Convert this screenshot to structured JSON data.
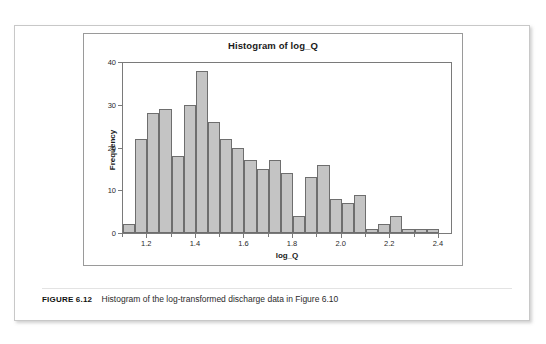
{
  "figure": {
    "caption_label": "FIGURE 6.12",
    "caption_text": "Histogram of the log-transformed discharge data in Figure 6.10"
  },
  "colors": {
    "bar_fill": "#c4c4c4",
    "bar_stroke": "#6e6e6e",
    "axis": "#7a7a7a",
    "panel_border": "#c8c8c8",
    "plot_border": "#9a9a9a",
    "text": "#1a1a1a",
    "page_background": "#ffffff"
  },
  "chart_data": {
    "type": "bar",
    "title": "Histogram of log_Q",
    "xlabel": "log_Q",
    "ylabel": "Frequency",
    "xlim": [
      1.1,
      2.45
    ],
    "ylim": [
      0,
      40
    ],
    "grid": false,
    "legend": null,
    "bin_width": 0.05,
    "x_ticks": [
      1.2,
      1.4,
      1.6,
      1.8,
      2.0,
      2.2,
      2.4
    ],
    "x_tick_labels": [
      "1.2",
      "1.4",
      "1.6",
      "1.8",
      "2.0",
      "2.2",
      "2.4"
    ],
    "x_minor_ticks": [
      1.1,
      1.3,
      1.5,
      1.7,
      1.9,
      2.1,
      2.3
    ],
    "y_ticks": [
      0,
      10,
      20,
      30,
      40
    ],
    "y_tick_labels": [
      "0",
      "10",
      "20",
      "30",
      "40"
    ],
    "bins": [
      {
        "left": 1.1,
        "right": 1.15,
        "center": 1.125,
        "value": 2
      },
      {
        "left": 1.15,
        "right": 1.2,
        "center": 1.175,
        "value": 22
      },
      {
        "left": 1.2,
        "right": 1.25,
        "center": 1.225,
        "value": 28
      },
      {
        "left": 1.25,
        "right": 1.3,
        "center": 1.275,
        "value": 29
      },
      {
        "left": 1.3,
        "right": 1.35,
        "center": 1.325,
        "value": 18
      },
      {
        "left": 1.35,
        "right": 1.4,
        "center": 1.375,
        "value": 30
      },
      {
        "left": 1.4,
        "right": 1.45,
        "center": 1.425,
        "value": 38
      },
      {
        "left": 1.45,
        "right": 1.5,
        "center": 1.475,
        "value": 26
      },
      {
        "left": 1.5,
        "right": 1.55,
        "center": 1.525,
        "value": 22
      },
      {
        "left": 1.55,
        "right": 1.6,
        "center": 1.575,
        "value": 20
      },
      {
        "left": 1.6,
        "right": 1.65,
        "center": 1.625,
        "value": 17
      },
      {
        "left": 1.65,
        "right": 1.7,
        "center": 1.675,
        "value": 15
      },
      {
        "left": 1.7,
        "right": 1.75,
        "center": 1.725,
        "value": 17
      },
      {
        "left": 1.75,
        "right": 1.8,
        "center": 1.775,
        "value": 14
      },
      {
        "left": 1.8,
        "right": 1.85,
        "center": 1.825,
        "value": 4
      },
      {
        "left": 1.85,
        "right": 1.9,
        "center": 1.875,
        "value": 13
      },
      {
        "left": 1.9,
        "right": 1.95,
        "center": 1.925,
        "value": 16
      },
      {
        "left": 1.95,
        "right": 2.0,
        "center": 1.975,
        "value": 8
      },
      {
        "left": 2.0,
        "right": 2.05,
        "center": 2.025,
        "value": 7
      },
      {
        "left": 2.05,
        "right": 2.1,
        "center": 2.075,
        "value": 9
      },
      {
        "left": 2.1,
        "right": 2.15,
        "center": 2.125,
        "value": 1
      },
      {
        "left": 2.15,
        "right": 2.2,
        "center": 2.175,
        "value": 2
      },
      {
        "left": 2.2,
        "right": 2.25,
        "center": 2.225,
        "value": 4
      },
      {
        "left": 2.25,
        "right": 2.3,
        "center": 2.275,
        "value": 1
      },
      {
        "left": 2.3,
        "right": 2.35,
        "center": 2.325,
        "value": 1
      },
      {
        "left": 2.35,
        "right": 2.4,
        "center": 2.375,
        "value": 1
      }
    ]
  }
}
